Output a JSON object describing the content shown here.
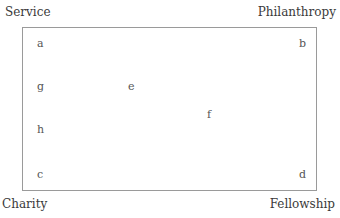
{
  "corners": {
    "top_left": "Service",
    "top_right": "Philanthropy",
    "bottom_left": "Charity",
    "bottom_right": "Fellowship"
  },
  "points": [
    {
      "label": "a",
      "x": 40,
      "y": 45
    },
    {
      "label": "b",
      "x": 302,
      "y": 45
    },
    {
      "label": "g",
      "x": 40,
      "y": 88
    },
    {
      "label": "e",
      "x": 131,
      "y": 88
    },
    {
      "label": "f",
      "x": 209,
      "y": 116
    },
    {
      "label": "h",
      "x": 40,
      "y": 131
    },
    {
      "label": "c",
      "x": 40,
      "y": 176
    },
    {
      "label": "d",
      "x": 302,
      "y": 176
    }
  ]
}
